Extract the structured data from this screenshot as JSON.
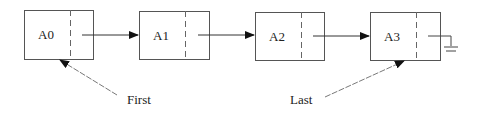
{
  "nodes": [
    {
      "label": "A0",
      "x": 24,
      "y": 10,
      "w": 69,
      "h": 49,
      "div": 70
    },
    {
      "label": "A1",
      "x": 139,
      "y": 11,
      "w": 70,
      "h": 48,
      "div": 185
    },
    {
      "label": "A2",
      "x": 255,
      "y": 12,
      "w": 69,
      "h": 48,
      "div": 301
    },
    {
      "label": "A3",
      "x": 370,
      "y": 12,
      "w": 70,
      "h": 48,
      "div": 416
    }
  ],
  "pointers": {
    "first": {
      "label": "First"
    },
    "last": {
      "label": "Last"
    }
  },
  "null_terminator": "ground-symbol"
}
